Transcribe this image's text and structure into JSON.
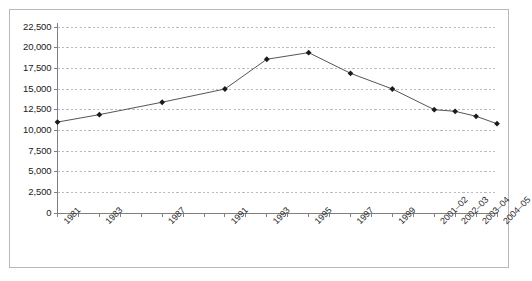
{
  "chart_data": {
    "type": "line",
    "title": "",
    "xlabel": "",
    "ylabel": "",
    "ylim": [
      0,
      22500
    ],
    "ytick_step": 2500,
    "grid": true,
    "grid_style": "dashed-horizontal",
    "legend": "none",
    "marker": "filled-diamond",
    "line_color": "#555555",
    "marker_color": "#1a1a1a",
    "grid_color": "#9b9bb0",
    "frame_color": "#b8b8b8",
    "axis_color": "#808080",
    "ytick_labels": [
      "22,500",
      "20,000",
      "17,500",
      "15,000",
      "12,500",
      "10,000",
      "7,500",
      "5,000",
      "2,500",
      "0"
    ],
    "ytick_values": [
      22500,
      20000,
      17500,
      15000,
      12500,
      10000,
      7500,
      5000,
      2500,
      0
    ],
    "xtick_labels": [
      "1981",
      "",
      "1983",
      "",
      "",
      "1987",
      "",
      "",
      "1991",
      "",
      "1993",
      "",
      "1995",
      "",
      "1997",
      "",
      "1999",
      "",
      "2001–02",
      "2002–03",
      "2003–04",
      "2004–05"
    ],
    "categories": [
      "1981",
      "1983",
      "1987",
      "1991",
      "1993",
      "1995",
      "1997",
      "1999",
      "2001–02",
      "2002–03",
      "2003–04",
      "2004–05"
    ],
    "category_tick_index": [
      0,
      2,
      5,
      8,
      10,
      12,
      14,
      16,
      18,
      19,
      20,
      21
    ],
    "values": [
      11000,
      11900,
      13400,
      15000,
      18600,
      19400,
      16900,
      15000,
      12500,
      12300,
      11700,
      10800
    ],
    "n_xticks": 22
  }
}
